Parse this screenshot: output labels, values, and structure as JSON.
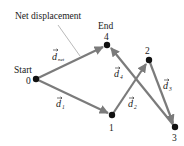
{
  "figure": {
    "title_annotation": "Net displacement",
    "colors": {
      "arrow": "#7b7b7b",
      "point": "#111111",
      "text": "#1a1a1a",
      "leader_line": "#8a8a8a"
    },
    "points": [
      {
        "id": "0",
        "label": "0",
        "caption": "Start",
        "x": 36,
        "y": 79
      },
      {
        "id": "1",
        "label": "1",
        "caption": "",
        "x": 112,
        "y": 115
      },
      {
        "id": "2",
        "label": "2",
        "caption": "",
        "x": 149,
        "y": 60
      },
      {
        "id": "3",
        "label": "3",
        "caption": "",
        "x": 175,
        "y": 127
      },
      {
        "id": "4",
        "label": "4",
        "caption": "End",
        "x": 107,
        "y": 45
      }
    ],
    "vectors": [
      {
        "name": "d1",
        "symbol": "d",
        "subscript": "1",
        "from": "0",
        "to": "1"
      },
      {
        "name": "d2",
        "symbol": "d",
        "subscript": "2",
        "from": "1",
        "to": "2"
      },
      {
        "name": "d3",
        "symbol": "d",
        "subscript": "3",
        "from": "2",
        "to": "3"
      },
      {
        "name": "d4",
        "symbol": "d",
        "subscript": "4",
        "from": "3",
        "to": "4"
      },
      {
        "name": "dnet",
        "symbol": "d",
        "subscript": "net",
        "from": "0",
        "to": "4"
      }
    ],
    "labels": {
      "start": "Start",
      "end": "End",
      "net_displacement": "Net displacement",
      "p0": "0",
      "p1": "1",
      "p2": "2",
      "p3": "3",
      "p4": "4",
      "d_symbol": "d",
      "sub_1": "1",
      "sub_2": "2",
      "sub_3": "3",
      "sub_4": "4",
      "sub_net": "net"
    }
  }
}
